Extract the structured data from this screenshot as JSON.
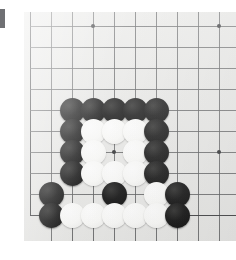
{
  "scene": {
    "subject": "go-board-photograph",
    "game": "Go",
    "board_size_lines": 19,
    "visible_region": "bottom-left corner area of board",
    "board_color": "#e9e9e7",
    "gridline_color": "#595a5c",
    "edge_line_color": "#3a3b3d",
    "black_stone_color": "#141414",
    "white_stone_color": "#fbfbf9",
    "page_background": "#ffffff"
  },
  "edge_marker": {
    "label": "",
    "color": "#6f7073",
    "x": 0,
    "y": 9,
    "width": 5,
    "height": 19
  },
  "board": {
    "origin_x": 6,
    "origin_y": 14,
    "spacing": 21,
    "columns": 10,
    "rows": 10,
    "left_edge_column": 0,
    "bottom_edge_row": 9,
    "star_points": [
      {
        "col": 3,
        "row": 0
      },
      {
        "col": 9,
        "row": 0
      },
      {
        "col": 4,
        "row": 6
      },
      {
        "col": 9,
        "row": 6
      }
    ]
  },
  "stones": [
    {
      "col": 2,
      "row": 4,
      "color": "black"
    },
    {
      "col": 3,
      "row": 4,
      "color": "black"
    },
    {
      "col": 4,
      "row": 4,
      "color": "black"
    },
    {
      "col": 5,
      "row": 4,
      "color": "black"
    },
    {
      "col": 6,
      "row": 4,
      "color": "black"
    },
    {
      "col": 2,
      "row": 5,
      "color": "black"
    },
    {
      "col": 3,
      "row": 5,
      "color": "white"
    },
    {
      "col": 4,
      "row": 5,
      "color": "white"
    },
    {
      "col": 5,
      "row": 5,
      "color": "white"
    },
    {
      "col": 6,
      "row": 5,
      "color": "black"
    },
    {
      "col": 2,
      "row": 6,
      "color": "black"
    },
    {
      "col": 3,
      "row": 6,
      "color": "white"
    },
    {
      "col": 5,
      "row": 6,
      "color": "white"
    },
    {
      "col": 6,
      "row": 6,
      "color": "black"
    },
    {
      "col": 2,
      "row": 7,
      "color": "black"
    },
    {
      "col": 3,
      "row": 7,
      "color": "white"
    },
    {
      "col": 4,
      "row": 7,
      "color": "white"
    },
    {
      "col": 5,
      "row": 7,
      "color": "white"
    },
    {
      "col": 6,
      "row": 7,
      "color": "black"
    },
    {
      "col": 1,
      "row": 8,
      "color": "black"
    },
    {
      "col": 4,
      "row": 8,
      "color": "black"
    },
    {
      "col": 6,
      "row": 8,
      "color": "white"
    },
    {
      "col": 7,
      "row": 8,
      "color": "black"
    },
    {
      "col": 1,
      "row": 9,
      "color": "black"
    },
    {
      "col": 2,
      "row": 9,
      "color": "white"
    },
    {
      "col": 3,
      "row": 9,
      "color": "white"
    },
    {
      "col": 4,
      "row": 9,
      "color": "white"
    },
    {
      "col": 5,
      "row": 9,
      "color": "white"
    },
    {
      "col": 6,
      "row": 9,
      "color": "white"
    },
    {
      "col": 7,
      "row": 9,
      "color": "black"
    }
  ]
}
